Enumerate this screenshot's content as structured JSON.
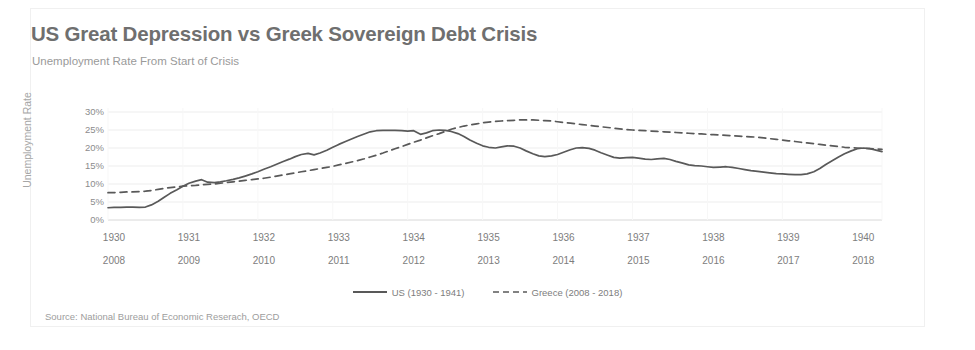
{
  "header": {
    "title": "US Great Depression vs Greek Sovereign Debt Crisis",
    "subtitle": "Unemployment Rate From Start of Crisis"
  },
  "source": {
    "text": "Source: National Bureau of Economic Reserach, OECD"
  },
  "colors": {
    "line": "#595959",
    "title": "#6f6f6f",
    "subtitle": "#9a9a9a",
    "tick": "#8c8c8c",
    "grid": "#ededed",
    "background": "#ffffff"
  },
  "legend": {
    "position": "bottom-center",
    "items": [
      {
        "label": "US (1930 - 1941)",
        "style": "solid"
      },
      {
        "label": "Greece (2008 - 2018)",
        "style": "dashed"
      }
    ]
  },
  "chart_data": {
    "type": "line",
    "title": "US Great Depression vs Greek Sovereign Debt Crisis",
    "subtitle": "Unemployment Rate From Start of Crisis",
    "xlabel": "",
    "ylabel": "Unemployment Rate",
    "ylim": [
      0,
      30
    ],
    "ytick_labels": [
      "30%",
      "25%",
      "20%",
      "15%",
      "10%",
      "5%",
      "0%"
    ],
    "ytick_values": [
      30,
      25,
      20,
      15,
      10,
      5,
      0
    ],
    "grid": true,
    "xaxis_rows": [
      {
        "name": "us-years",
        "labels": [
          "1930",
          "1931",
          "1932",
          "1933",
          "1934",
          "1935",
          "1936",
          "1937",
          "1938",
          "1939",
          "1940"
        ]
      },
      {
        "name": "greece-years",
        "labels": [
          "2008",
          "2009",
          "2010",
          "2011",
          "2012",
          "2013",
          "2014",
          "2015",
          "2016",
          "2017",
          "2018"
        ]
      }
    ],
    "x": [
      0,
      0.08,
      0.17,
      0.25,
      0.33,
      0.42,
      0.5,
      0.58,
      0.67,
      0.75,
      0.83,
      0.92,
      1.0,
      1.08,
      1.17,
      1.25,
      1.33,
      1.42,
      1.5,
      1.58,
      1.67,
      1.75,
      1.83,
      1.92,
      2.0,
      2.08,
      2.17,
      2.25,
      2.33,
      2.42,
      2.5,
      2.58,
      2.67,
      2.75,
      2.83,
      2.92,
      3.0,
      3.08,
      3.17,
      3.25,
      3.33,
      3.42,
      3.5,
      3.58,
      3.67,
      3.75,
      3.83,
      3.92,
      4.0,
      4.08,
      4.17,
      4.25,
      4.33,
      4.42,
      4.5,
      4.58,
      4.67,
      4.75,
      4.83,
      4.92,
      5.0,
      5.08,
      5.17,
      5.25,
      5.33,
      5.42,
      5.5,
      5.58,
      5.67,
      5.75,
      5.83,
      5.92,
      6.0,
      6.08,
      6.17,
      6.25,
      6.33,
      6.42,
      6.5,
      6.58,
      6.67,
      6.75,
      6.83,
      6.92,
      7.0,
      7.08,
      7.17,
      7.25,
      7.33,
      7.42,
      7.5,
      7.58,
      7.67,
      7.75,
      7.83,
      7.92,
      8.0,
      8.08,
      8.17,
      8.25,
      8.33,
      8.42,
      8.5,
      8.58,
      8.67,
      8.75,
      8.83,
      8.92,
      9.0,
      9.08,
      9.17,
      9.25,
      9.33,
      9.42,
      9.5,
      9.58,
      9.67,
      9.75,
      9.83,
      9.92,
      10.0,
      10.08,
      10.17,
      10.25,
      10.33
    ],
    "series": [
      {
        "name": "US (1930 - 1941)",
        "style": "solid",
        "values": [
          3.4,
          3.5,
          3.5,
          3.6,
          3.6,
          3.5,
          3.6,
          4.2,
          5.2,
          6.3,
          7.4,
          8.4,
          9.4,
          10.2,
          10.8,
          11.2,
          10.5,
          10.4,
          10.6,
          10.9,
          11.3,
          11.7,
          12.2,
          12.8,
          13.4,
          14.1,
          14.8,
          15.5,
          16.2,
          16.9,
          17.6,
          18.2,
          18.5,
          18.1,
          18.6,
          19.4,
          20.2,
          21.0,
          21.8,
          22.5,
          23.2,
          23.9,
          24.5,
          24.8,
          24.9,
          24.9,
          24.9,
          24.8,
          24.7,
          24.8,
          23.8,
          24.2,
          24.8,
          25.0,
          24.9,
          24.6,
          24.0,
          23.2,
          22.2,
          21.3,
          20.6,
          20.2,
          20.0,
          20.3,
          20.6,
          20.5,
          20.0,
          19.2,
          18.4,
          17.8,
          17.6,
          17.8,
          18.2,
          18.8,
          19.5,
          20.0,
          20.1,
          19.9,
          19.4,
          18.7,
          18.0,
          17.4,
          17.2,
          17.3,
          17.4,
          17.2,
          16.9,
          16.8,
          17.0,
          17.1,
          16.8,
          16.3,
          15.8,
          15.3,
          15.1,
          15.0,
          14.8,
          14.6,
          14.7,
          14.8,
          14.6,
          14.3,
          14.0,
          13.7,
          13.5,
          13.3,
          13.1,
          12.9,
          12.8,
          12.7,
          12.6,
          12.6,
          12.8,
          13.4,
          14.3,
          15.4,
          16.5,
          17.5,
          18.4,
          19.2,
          19.8,
          20.0,
          19.8,
          19.4,
          19.0
        ]
      },
      {
        "name": "Greece (2008 - 2018)",
        "style": "dashed",
        "values": [
          7.6,
          7.6,
          7.7,
          7.8,
          7.8,
          7.9,
          8.0,
          8.2,
          8.5,
          8.8,
          9.0,
          9.2,
          9.4,
          9.5,
          9.6,
          9.8,
          9.9,
          10.0,
          10.2,
          10.4,
          10.6,
          10.8,
          11.0,
          11.2,
          11.4,
          11.6,
          11.9,
          12.2,
          12.5,
          12.8,
          13.1,
          13.4,
          13.7,
          14.0,
          14.3,
          14.6,
          14.9,
          15.3,
          15.7,
          16.1,
          16.5,
          17.0,
          17.5,
          18.0,
          18.6,
          19.2,
          19.8,
          20.4,
          21.0,
          21.6,
          22.2,
          22.8,
          23.4,
          24.0,
          24.6,
          25.2,
          25.7,
          26.1,
          26.4,
          26.7,
          27.0,
          27.2,
          27.4,
          27.5,
          27.6,
          27.7,
          27.8,
          27.8,
          27.8,
          27.7,
          27.6,
          27.5,
          27.3,
          27.1,
          26.9,
          26.7,
          26.5,
          26.3,
          26.1,
          25.9,
          25.7,
          25.5,
          25.3,
          25.1,
          25.0,
          24.9,
          24.8,
          24.7,
          24.6,
          24.5,
          24.4,
          24.3,
          24.2,
          24.1,
          24.0,
          23.9,
          23.8,
          23.7,
          23.6,
          23.5,
          23.4,
          23.3,
          23.2,
          23.1,
          23.0,
          22.8,
          22.6,
          22.4,
          22.2,
          22.0,
          21.8,
          21.6,
          21.4,
          21.2,
          21.0,
          20.8,
          20.6,
          20.4,
          20.2,
          20.1,
          20.0,
          19.9,
          19.8,
          19.7,
          19.6
        ]
      }
    ]
  }
}
